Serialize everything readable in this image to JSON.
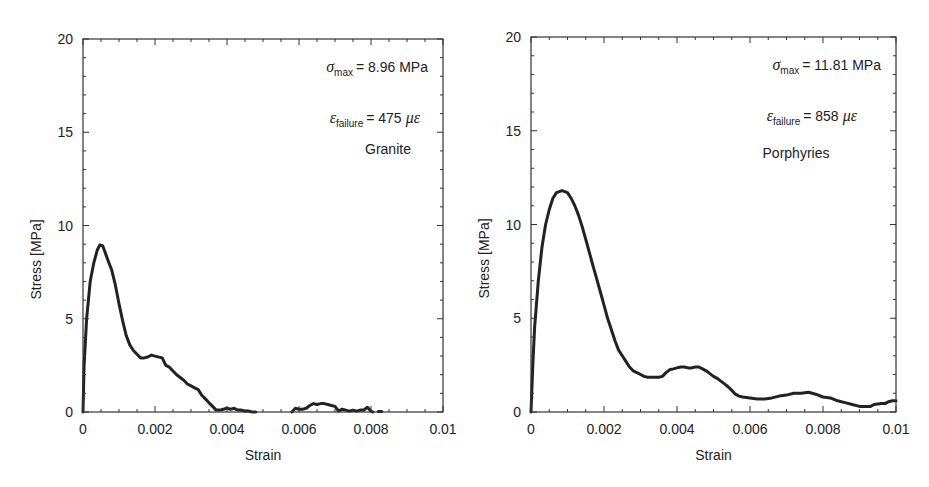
{
  "figure": {
    "panels": [
      {
        "id": "granite",
        "plot_box": {
          "left": 83,
          "top": 39,
          "right": 443,
          "bottom": 412
        },
        "annotations": {
          "sigma_symbol": "σ",
          "sigma_sub": "max",
          "sigma_value": "= 8.96 MPa",
          "eps_symbol": "ε",
          "eps_sub": "failure",
          "eps_value_num": "= 475",
          "eps_unit": "με",
          "material": "Granite"
        }
      },
      {
        "id": "porphyries",
        "plot_box": {
          "left": 531,
          "top": 37,
          "right": 896,
          "bottom": 412
        },
        "annotations": {
          "sigma_symbol": "σ",
          "sigma_sub": "max",
          "sigma_value": "= 11.81 MPa",
          "eps_symbol": "ε",
          "eps_sub": "failure",
          "eps_value_num": "= 858",
          "eps_unit": "με",
          "material": "Porphyries"
        }
      }
    ]
  },
  "chart_data": [
    {
      "type": "line",
      "title": "Granite",
      "xlabel": "Strain",
      "ylabel": "Stress [MPa]",
      "xlim": [
        0,
        0.01
      ],
      "ylim": [
        0,
        20
      ],
      "xticks": [
        0,
        0.002,
        0.004,
        0.006,
        0.008,
        0.01
      ],
      "xtick_labels": [
        "0",
        "0.002",
        "0.004",
        "0.006",
        "0.008",
        "0.01"
      ],
      "yticks": [
        0,
        5,
        10,
        15,
        20
      ],
      "ytick_labels": [
        "0",
        "5",
        "10",
        "15",
        "20"
      ],
      "grid": false,
      "legend": null,
      "annotations": [
        "σmax = 8.96 MPa",
        "εfailure = 475 με",
        "Granite"
      ],
      "series": [
        {
          "name": "Granite",
          "x": [
            0,
            3e-05,
            0.0001,
            0.0002,
            0.0003,
            0.0004,
            0.00047,
            0.00055,
            0.0007,
            0.0008,
            0.0009,
            0.001,
            0.0011,
            0.0012,
            0.0013,
            0.0014,
            0.0015,
            0.0016,
            0.0017,
            0.0018,
            0.0019,
            0.002,
            0.0022,
            0.0023,
            0.0024,
            0.0025,
            0.0026,
            0.0027,
            0.0028,
            0.0029,
            0.003,
            0.0031,
            0.0032,
            0.0033,
            0.0034,
            0.0035,
            0.0036,
            0.0037,
            0.0038,
            0.0039,
            0.004,
            0.0041,
            0.0042,
            0.0043,
            0.0044,
            0.0045,
            0.0046,
            0.0047,
            0.0048
          ],
          "y": [
            0,
            2.5,
            5.0,
            7.0,
            8.0,
            8.7,
            8.96,
            8.9,
            8.1,
            7.6,
            6.8,
            5.8,
            4.9,
            4.1,
            3.6,
            3.3,
            3.1,
            2.9,
            2.9,
            2.95,
            3.05,
            3.0,
            2.9,
            2.5,
            2.4,
            2.2,
            2.0,
            1.85,
            1.7,
            1.5,
            1.4,
            1.3,
            1.2,
            0.9,
            0.7,
            0.5,
            0.3,
            0.1,
            0.1,
            0.15,
            0.2,
            0.15,
            0.2,
            0.1,
            0.1,
            0.05,
            0.05,
            0.0,
            0.0
          ]
        },
        {
          "name": "Granite (post-failure fragment)",
          "x": [
            0.0058,
            0.0059,
            0.006,
            0.0061,
            0.0062,
            0.0063,
            0.0064,
            0.0065,
            0.0066,
            0.0067,
            0.0068,
            0.0069,
            0.007,
            0.0071,
            0.0072,
            0.0073,
            0.0074,
            0.0075,
            0.0076,
            0.0077,
            0.0078,
            0.0079,
            0.008,
            0.00805
          ],
          "y": [
            0.0,
            0.2,
            0.15,
            0.15,
            0.2,
            0.35,
            0.45,
            0.4,
            0.45,
            0.45,
            0.4,
            0.35,
            0.3,
            0.05,
            0.15,
            0.1,
            0.05,
            0.1,
            0.05,
            0.1,
            0.1,
            0.25,
            0.05,
            0.0
          ]
        },
        {
          "name": "Granite (end point)",
          "x": [
            0.0082,
            0.0083
          ],
          "y": [
            0.03,
            0.03
          ]
        }
      ]
    },
    {
      "type": "line",
      "title": "Porphyries",
      "xlabel": "Strain",
      "ylabel": "Stress [MPa]",
      "xlim": [
        0,
        0.01
      ],
      "ylim": [
        0,
        20
      ],
      "xticks": [
        0,
        0.002,
        0.004,
        0.006,
        0.008,
        0.01
      ],
      "xtick_labels": [
        "0",
        "0.002",
        "0.004",
        "0.006",
        "0.008",
        "0.01"
      ],
      "yticks": [
        0,
        5,
        10,
        15,
        20
      ],
      "ytick_labels": [
        "0",
        "5",
        "10",
        "15",
        "20"
      ],
      "grid": false,
      "legend": null,
      "annotations": [
        "σmax = 11.81 MPa",
        "εfailure = 858 με",
        "Porphyries"
      ],
      "series": [
        {
          "name": "Porphyries",
          "x": [
            0,
            5e-05,
            0.0001,
            0.0002,
            0.0003,
            0.0004,
            0.0005,
            0.0006,
            0.0007,
            0.00085,
            0.001,
            0.0011,
            0.0012,
            0.0013,
            0.0014,
            0.0015,
            0.0016,
            0.0017,
            0.0018,
            0.0019,
            0.002,
            0.0021,
            0.0022,
            0.0023,
            0.0024,
            0.0025,
            0.0026,
            0.0027,
            0.0028,
            0.0029,
            0.003,
            0.0031,
            0.0032,
            0.0033,
            0.0034,
            0.0035,
            0.0036,
            0.0037,
            0.0038,
            0.0039,
            0.004,
            0.0041,
            0.0042,
            0.0043,
            0.0044,
            0.0045,
            0.0046,
            0.0047,
            0.0048,
            0.0049,
            0.005,
            0.0051,
            0.0052,
            0.0053,
            0.0054,
            0.0055,
            0.0056,
            0.0057,
            0.0058,
            0.006,
            0.0062,
            0.0064,
            0.0066,
            0.0068,
            0.007,
            0.0072,
            0.0074,
            0.0076,
            0.0078,
            0.008,
            0.0082,
            0.0084,
            0.0086,
            0.0088,
            0.009,
            0.0092,
            0.0093,
            0.0094,
            0.0096,
            0.0097,
            0.0098,
            0.0099,
            0.01
          ],
          "y": [
            0,
            2.5,
            4.5,
            7.0,
            8.8,
            10.0,
            10.8,
            11.4,
            11.7,
            11.81,
            11.7,
            11.4,
            11.0,
            10.5,
            9.9,
            9.2,
            8.5,
            7.8,
            7.1,
            6.4,
            5.7,
            5.0,
            4.4,
            3.8,
            3.3,
            3.0,
            2.7,
            2.4,
            2.2,
            2.1,
            2.0,
            1.9,
            1.85,
            1.85,
            1.85,
            1.85,
            1.9,
            2.1,
            2.25,
            2.3,
            2.35,
            2.4,
            2.4,
            2.35,
            2.35,
            2.4,
            2.4,
            2.3,
            2.2,
            2.05,
            1.9,
            1.8,
            1.65,
            1.5,
            1.35,
            1.15,
            0.95,
            0.85,
            0.8,
            0.75,
            0.7,
            0.7,
            0.75,
            0.85,
            0.9,
            1.0,
            1.0,
            1.05,
            0.95,
            0.8,
            0.75,
            0.6,
            0.5,
            0.4,
            0.3,
            0.3,
            0.3,
            0.4,
            0.45,
            0.45,
            0.55,
            0.6,
            0.6
          ]
        }
      ]
    }
  ]
}
